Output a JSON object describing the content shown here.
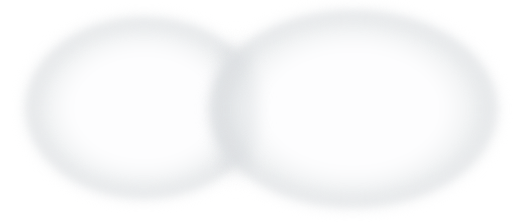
{
  "canvas": {
    "width": 530,
    "height": 222,
    "background": "#ffffff"
  },
  "diagram": {
    "type": "venn",
    "set_count": 2,
    "has_labels": false,
    "has_title": false,
    "overlap_region_label": ""
  },
  "chart_data": {
    "type": "venn",
    "title": "",
    "sets": [
      {
        "name": "left-set",
        "label": "",
        "center_x": 144,
        "center_y": 108,
        "radius_x": 119,
        "radius_y": 91
      },
      {
        "name": "right-set",
        "label": "",
        "center_x": 353,
        "center_y": 109,
        "radius_x": 145,
        "radius_y": 99
      }
    ],
    "intersection": {
      "label": "",
      "x_start": 208,
      "x_end": 262
    }
  },
  "style": {
    "rim_color": "#e6e8ea",
    "rim_color_soft": "#eef0f1",
    "interior_color": "#fdfdfe",
    "overlap_color": "#e9ebed",
    "background": "#ffffff"
  },
  "left_set": {
    "left": 25,
    "top": 17,
    "width": 238,
    "height": 182
  },
  "right_set": {
    "left": 208,
    "top": 10,
    "width": 290,
    "height": 198
  },
  "overlap": {
    "left": 206,
    "top": 30,
    "width": 60,
    "height": 160
  }
}
